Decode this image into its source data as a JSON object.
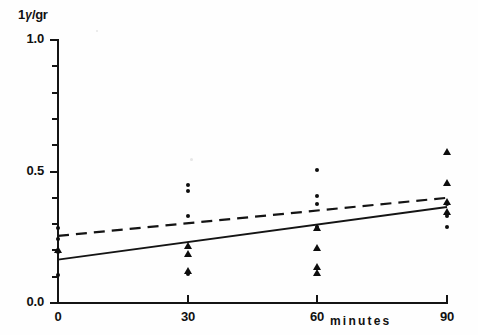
{
  "chart_data": {
    "type": "scatter",
    "title": "",
    "xlabel": "minutes",
    "ylabel": "1 γ/gr",
    "xlim": [
      0,
      90
    ],
    "ylim": [
      0.0,
      1.0
    ],
    "grid": false,
    "legend": "none",
    "x_ticks": [
      0,
      30,
      60,
      90
    ],
    "x_tick_labels": [
      "0",
      "30",
      "60",
      "90"
    ],
    "y_ticks": [
      0.0,
      0.5,
      1.0
    ],
    "y_tick_labels": [
      "0.0",
      "0.5",
      "1.0"
    ],
    "y_minor_ticks": [
      0.1,
      0.2,
      0.3,
      0.4,
      0.6,
      0.7,
      0.8,
      0.9
    ],
    "series": [
      {
        "name": "circles",
        "marker": "circle",
        "points": [
          {
            "x": 0,
            "y": 0.285
          },
          {
            "x": 0,
            "y": 0.245
          },
          {
            "x": 0,
            "y": 0.195
          },
          {
            "x": 0,
            "y": 0.105
          },
          {
            "x": 30,
            "y": 0.45
          },
          {
            "x": 30,
            "y": 0.425
          },
          {
            "x": 30,
            "y": 0.33
          },
          {
            "x": 30,
            "y": 0.11
          },
          {
            "x": 60,
            "y": 0.505
          },
          {
            "x": 60,
            "y": 0.405
          },
          {
            "x": 60,
            "y": 0.375
          },
          {
            "x": 60,
            "y": 0.29
          },
          {
            "x": 90,
            "y": 0.375
          },
          {
            "x": 90,
            "y": 0.33
          },
          {
            "x": 90,
            "y": 0.29
          }
        ]
      },
      {
        "name": "triangles",
        "marker": "triangle",
        "points": [
          {
            "x": 0,
            "y": 0.2
          },
          {
            "x": 30,
            "y": 0.215
          },
          {
            "x": 30,
            "y": 0.185
          },
          {
            "x": 30,
            "y": 0.12
          },
          {
            "x": 60,
            "y": 0.285
          },
          {
            "x": 60,
            "y": 0.21
          },
          {
            "x": 60,
            "y": 0.135
          },
          {
            "x": 60,
            "y": 0.115
          },
          {
            "x": 90,
            "y": 0.575
          },
          {
            "x": 90,
            "y": 0.455
          },
          {
            "x": 90,
            "y": 0.385
          },
          {
            "x": 90,
            "y": 0.345
          }
        ]
      }
    ],
    "fit_lines": [
      {
        "name": "dashed-regression",
        "style": "dashed",
        "x0": 0,
        "y0": 0.255,
        "x1": 90,
        "y1": 0.4
      },
      {
        "name": "solid-regression",
        "style": "solid",
        "x0": 0,
        "y0": 0.165,
        "x1": 90,
        "y1": 0.365
      }
    ]
  }
}
